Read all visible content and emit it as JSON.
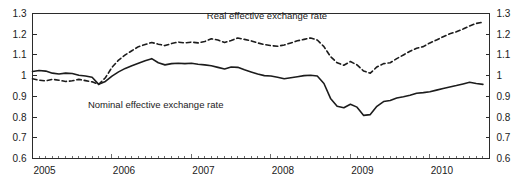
{
  "chart_data": {
    "type": "line",
    "title": "",
    "subtitle": "",
    "xlabel": "",
    "ylabel": "",
    "xlim": [
      2005.0,
      2010.75
    ],
    "ylim": [
      0.6,
      1.3
    ],
    "grid": false,
    "legend_position": "inline-annotation",
    "y_ticks": [
      "1.3",
      "1.2",
      "1.1",
      "1",
      "0.9",
      "0.8",
      "0.7",
      "0.6"
    ],
    "y_tick_values": [
      1.3,
      1.2,
      1.1,
      1.0,
      0.9,
      0.8,
      0.7,
      0.6
    ],
    "y_axis_right_ticks": [
      "1.3",
      "1.2",
      "1.1",
      "1",
      "0.9",
      "0.8",
      "0.7",
      "0.6"
    ],
    "x_ticks": [
      "2005",
      "2006",
      "2007",
      "2008",
      "2009",
      "2010"
    ],
    "x_tick_values": [
      2005,
      2006,
      2007,
      2008,
      2009,
      2010
    ],
    "minor_tick_interval_years": 0.08333,
    "series": [
      {
        "name": "Real effective exchange rate",
        "style": "dashed",
        "label_x": 2007.95,
        "label_y": 1.272,
        "x": [
          2005.0,
          2005.083,
          2005.167,
          2005.25,
          2005.333,
          2005.417,
          2005.5,
          2005.583,
          2005.667,
          2005.75,
          2005.833,
          2005.917,
          2006.0,
          2006.083,
          2006.167,
          2006.25,
          2006.333,
          2006.417,
          2006.5,
          2006.583,
          2006.667,
          2006.75,
          2006.833,
          2006.917,
          2007.0,
          2007.083,
          2007.167,
          2007.25,
          2007.333,
          2007.417,
          2007.5,
          2007.583,
          2007.667,
          2007.75,
          2007.833,
          2007.917,
          2008.0,
          2008.083,
          2008.167,
          2008.25,
          2008.333,
          2008.417,
          2008.5,
          2008.583,
          2008.667,
          2008.75,
          2008.833,
          2008.917,
          2009.0,
          2009.083,
          2009.167,
          2009.25,
          2009.333,
          2009.417,
          2009.5,
          2009.583,
          2009.667,
          2009.75,
          2009.833,
          2009.917,
          2010.0,
          2010.083,
          2010.167,
          2010.25,
          2010.333,
          2010.417,
          2010.5,
          2010.583,
          2010.667
        ],
        "y": [
          0.985,
          0.978,
          0.975,
          0.982,
          0.978,
          0.972,
          0.975,
          0.982,
          0.976,
          0.97,
          0.958,
          0.99,
          1.04,
          1.075,
          1.1,
          1.12,
          1.14,
          1.15,
          1.16,
          1.152,
          1.145,
          1.155,
          1.162,
          1.158,
          1.162,
          1.158,
          1.165,
          1.178,
          1.172,
          1.16,
          1.17,
          1.182,
          1.175,
          1.168,
          1.158,
          1.15,
          1.145,
          1.142,
          1.148,
          1.158,
          1.168,
          1.175,
          1.182,
          1.172,
          1.14,
          1.092,
          1.062,
          1.05,
          1.068,
          1.052,
          1.022,
          1.012,
          1.042,
          1.058,
          1.062,
          1.082,
          1.1,
          1.118,
          1.132,
          1.14,
          1.158,
          1.172,
          1.188,
          1.202,
          1.212,
          1.225,
          1.24,
          1.252,
          1.258
        ]
      },
      {
        "name": "Nominal effective exchange rate",
        "style": "solid",
        "label_x": 2006.55,
        "label_y": 0.845,
        "x": [
          2005.0,
          2005.083,
          2005.167,
          2005.25,
          2005.333,
          2005.417,
          2005.5,
          2005.583,
          2005.667,
          2005.75,
          2005.833,
          2005.917,
          2006.0,
          2006.083,
          2006.167,
          2006.25,
          2006.333,
          2006.417,
          2006.5,
          2006.583,
          2006.667,
          2006.75,
          2006.833,
          2006.917,
          2007.0,
          2007.083,
          2007.167,
          2007.25,
          2007.333,
          2007.417,
          2007.5,
          2007.583,
          2007.667,
          2007.75,
          2007.833,
          2007.917,
          2008.0,
          2008.083,
          2008.167,
          2008.25,
          2008.333,
          2008.417,
          2008.5,
          2008.583,
          2008.667,
          2008.75,
          2008.833,
          2008.917,
          2009.0,
          2009.083,
          2009.167,
          2009.25,
          2009.333,
          2009.417,
          2009.5,
          2009.583,
          2009.667,
          2009.75,
          2009.833,
          2009.917,
          2010.0,
          2010.083,
          2010.167,
          2010.25,
          2010.333,
          2010.417,
          2010.5,
          2010.583,
          2010.667
        ],
        "y": [
          1.02,
          1.025,
          1.022,
          1.012,
          1.008,
          1.012,
          1.01,
          1.002,
          0.998,
          0.992,
          0.958,
          0.972,
          0.998,
          1.018,
          1.035,
          1.048,
          1.06,
          1.072,
          1.082,
          1.062,
          1.052,
          1.058,
          1.06,
          1.058,
          1.06,
          1.055,
          1.052,
          1.048,
          1.04,
          1.032,
          1.042,
          1.04,
          1.028,
          1.018,
          1.008,
          1.0,
          0.998,
          0.992,
          0.985,
          0.99,
          0.995,
          1.0,
          1.002,
          0.998,
          0.962,
          0.89,
          0.852,
          0.845,
          0.862,
          0.848,
          0.808,
          0.812,
          0.852,
          0.875,
          0.88,
          0.892,
          0.898,
          0.905,
          0.915,
          0.918,
          0.922,
          0.93,
          0.938,
          0.945,
          0.952,
          0.96,
          0.968,
          0.962,
          0.958
        ]
      }
    ]
  },
  "top_crop": {
    "text": ""
  }
}
